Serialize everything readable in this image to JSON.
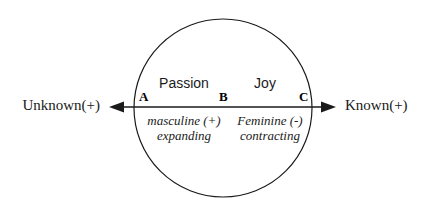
{
  "diagram": {
    "shape": {
      "circle_name": "main-circle",
      "stroke_color": "#1a1a1a",
      "fill_color": "#ffffff"
    },
    "axis": {
      "line_color": "#1a1a1a",
      "left_label": "Unknown(+)",
      "right_label": "Known(+)",
      "left_arrow_icon": "arrow-left-icon",
      "right_arrow_icon": "arrow-right-icon"
    },
    "points": [
      {
        "id": "A",
        "label": "A"
      },
      {
        "id": "B",
        "label": "B"
      },
      {
        "id": "C",
        "label": "C"
      }
    ],
    "regions": {
      "upper_left": "Passion",
      "upper_right": "Joy"
    },
    "qualities": {
      "left": {
        "line1": "masculine (+)",
        "line2": "expanding"
      },
      "right": {
        "line1": "Feminine (-)",
        "line2": "contracting"
      }
    }
  }
}
